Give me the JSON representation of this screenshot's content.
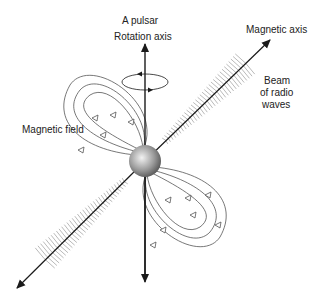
{
  "diagram": {
    "title": "A pulsar",
    "labels": {
      "rotation_axis": "Rotation axis",
      "magnetic_axis": "Magnetic axis",
      "beam_line1": "Beam",
      "beam_line2": "of radio",
      "beam_line3": "waves",
      "magnetic_field": "Magnetic field"
    },
    "colors": {
      "line": "#1a1a1a",
      "field": "#555555",
      "hatch": "#8a8a8a"
    }
  }
}
